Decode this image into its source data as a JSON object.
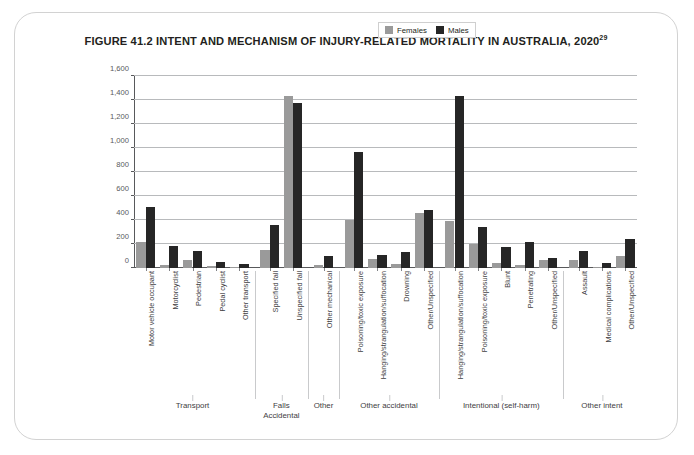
{
  "figure": {
    "title": "FIGURE 41.2 INTENT AND MECHANISM OF INJURY-RELATED MORTALITY IN AUSTRALIA, 2020",
    "title_superscript": "29"
  },
  "legend": {
    "position": "top-right",
    "entries": [
      {
        "label": "Females",
        "color": "#9a9a9a"
      },
      {
        "label": "Males",
        "color": "#262626"
      }
    ]
  },
  "groups": [
    {
      "label": "Transport",
      "sub": ""
    },
    {
      "label": "Falls",
      "sub": "Accidental"
    },
    {
      "label": "Other",
      "sub": ""
    },
    {
      "label": "Other accidental",
      "sub": ""
    },
    {
      "label": "Intentional (self-harm)",
      "sub": ""
    },
    {
      "label": "Other intent",
      "sub": ""
    }
  ],
  "chart_data": {
    "type": "bar",
    "title": "FIGURE 41.2 INTENT AND MECHANISM OF INJURY-RELATED MORTALITY IN AUSTRALIA, 2020",
    "xlabel": "",
    "ylabel": "",
    "ylim": [
      0,
      1600
    ],
    "ytick_step": 200,
    "yticks": [
      0,
      200,
      400,
      600,
      800,
      1000,
      1200,
      1400,
      1600
    ],
    "ytick_labels": [
      "0",
      "200",
      "400",
      "600",
      "800",
      "1,000",
      "1,200",
      "1,400",
      "1,600"
    ],
    "grid": true,
    "legend_position": "top-right",
    "categories": [
      "Motor vehicle occupant",
      "Motorcyclist",
      "Pedestrian",
      "Pedal cyclist",
      "Other transport",
      "Specified fall",
      "Unspecified fall",
      "Other mechanical",
      "Poisoning/toxic exposure",
      "Hanging/strangulation/suffocation",
      "Drowning",
      "Other/Unspecified",
      "Hanging/strangulation/suffocation",
      "Poisoning/toxic exposure",
      "Blunt",
      "Penetrating",
      "Other/Unspecified",
      "Assault",
      "Medical complications",
      "Other/Unspecified"
    ],
    "group_spans": [
      {
        "name": "Transport",
        "start": 0,
        "end": 4
      },
      {
        "name": "Falls",
        "start": 5,
        "end": 6
      },
      {
        "name": "Other",
        "start": 7,
        "end": 7
      },
      {
        "name": "Other accidental",
        "start": 8,
        "end": 11
      },
      {
        "name": "Intentional (self-harm)",
        "start": 12,
        "end": 16
      },
      {
        "name": "Other intent",
        "start": 17,
        "end": 19
      }
    ],
    "series": [
      {
        "name": "Females",
        "color": "#9a9a9a",
        "values": [
          220,
          25,
          65,
          15,
          10,
          150,
          1430,
          25,
          400,
          75,
          35,
          460,
          395,
          200,
          45,
          25,
          65,
          70,
          5,
          100
        ]
      },
      {
        "name": "Males",
        "color": "#262626",
        "values": [
          510,
          180,
          145,
          50,
          35,
          355,
          1375,
          100,
          965,
          105,
          135,
          480,
          1430,
          345,
          175,
          215,
          80,
          145,
          45,
          240
        ]
      }
    ]
  }
}
